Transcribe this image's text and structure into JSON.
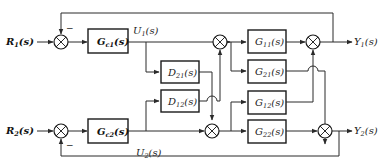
{
  "diagram": {
    "type": "block-diagram",
    "inputs": [
      {
        "id": "R1",
        "base": "R",
        "sub": "1",
        "arg": "(s)"
      },
      {
        "id": "R2",
        "base": "R",
        "sub": "2",
        "arg": "(s)"
      }
    ],
    "outputs": [
      {
        "id": "Y1",
        "base": "Y",
        "sub": "1",
        "arg": "(s)"
      },
      {
        "id": "Y2",
        "base": "Y",
        "sub": "2",
        "arg": "(s)"
      }
    ],
    "signals": [
      {
        "id": "U1",
        "base": "U",
        "sub": "1",
        "arg": "(s)"
      },
      {
        "id": "U2",
        "base": "U",
        "sub": "2",
        "arg": "(s)"
      }
    ],
    "blocks": {
      "Gc1": {
        "base": "G",
        "sub": "c1",
        "arg": "(s)"
      },
      "Gc2": {
        "base": "G",
        "sub": "c2",
        "arg": "(s)"
      },
      "D21": {
        "base": "D",
        "sub": "21",
        "arg": "(s)"
      },
      "D12": {
        "base": "D",
        "sub": "12",
        "arg": "(s)"
      },
      "G11": {
        "base": "G",
        "sub": "11",
        "arg": "(s)"
      },
      "G21": {
        "base": "G",
        "sub": "21",
        "arg": "(s)"
      },
      "G12": {
        "base": "G",
        "sub": "12",
        "arg": "(s)"
      },
      "G22": {
        "base": "G",
        "sub": "22",
        "arg": "(s)"
      }
    },
    "signs": {
      "feedback1": "−",
      "feedback2": "−"
    },
    "connections": [
      "R1 -> S1",
      "Y1 -> S1 (−)",
      "S1 -> Gc1",
      "Gc1 -> U1",
      "U1 -> S3",
      "U1 -> D21",
      "D21 -> S4",
      "D12 -> S3",
      "S3 -> G11",
      "S3 -> G21",
      "G11 -> S5",
      "G12 -> S5",
      "S5 -> Y1",
      "R2 -> S2",
      "Y2 -> S2 (−)",
      "S2 -> Gc2",
      "Gc2 -> U2",
      "U2 -> S4",
      "U2 -> D12",
      "S4 -> G12",
      "S4 -> G22",
      "G22 -> S6",
      "G21 -> S6",
      "S6 -> Y2"
    ]
  }
}
